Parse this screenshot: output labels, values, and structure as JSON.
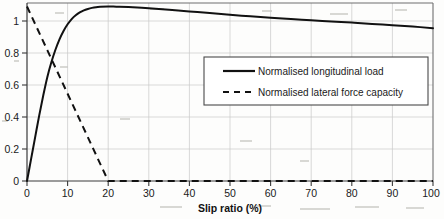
{
  "chart_data": {
    "type": "line",
    "title": "",
    "xlabel": "Slip ratio  (%)",
    "ylabel": "",
    "xlim": [
      0,
      100
    ],
    "ylim": [
      0,
      1.02
    ],
    "grid": true,
    "legend_position": "center-right",
    "xticks": [
      0,
      10,
      20,
      30,
      40,
      50,
      60,
      70,
      80,
      90,
      100
    ],
    "xticklabels": [
      "0",
      "10",
      "20",
      "30",
      "40",
      "50",
      "60",
      "70",
      "80",
      "90",
      "100"
    ],
    "yticks": [
      0,
      0.2,
      0.4,
      0.6,
      0.8,
      1
    ],
    "yticklabels": [
      "0",
      "0.2",
      "0.4",
      "0.6",
      "0.8",
      "1"
    ],
    "series": [
      {
        "name": "Normalised longitudinal load",
        "style": "solid",
        "color": "#111111",
        "x": [
          0,
          1,
          2,
          3,
          4,
          5,
          6,
          7,
          8,
          9,
          10,
          11,
          12,
          13,
          14,
          15,
          16,
          17,
          18,
          20,
          22,
          25,
          30,
          35,
          40,
          45,
          50,
          55,
          60,
          65,
          70,
          75,
          80,
          85,
          90,
          95,
          100
        ],
        "values": [
          0,
          0.125,
          0.25,
          0.375,
          0.49,
          0.595,
          0.68,
          0.752,
          0.812,
          0.86,
          0.898,
          0.928,
          0.95,
          0.966,
          0.978,
          0.986,
          0.992,
          0.996,
          0.998,
          1.0,
          0.999,
          0.997,
          0.99,
          0.981,
          0.972,
          0.962,
          0.952,
          0.944,
          0.936,
          0.928,
          0.921,
          0.914,
          0.908,
          0.9,
          0.893,
          0.885,
          0.876
        ]
      },
      {
        "name": "Normalised lateral force capacity",
        "style": "dashed",
        "color": "#111111",
        "x": [
          0,
          5,
          10,
          15,
          20,
          30,
          40,
          50,
          60,
          70,
          80,
          90,
          100
        ],
        "values": [
          1.0,
          0.75,
          0.5,
          0.25,
          0.0,
          0.0,
          0.0,
          0.0,
          0.0,
          0.0,
          0.0,
          0.0,
          0.0
        ]
      }
    ],
    "legend": [
      {
        "label": "Normalised longitudinal load",
        "style": "solid"
      },
      {
        "label": "Normalised lateral force capacity",
        "style": "dashed"
      }
    ]
  },
  "colors": {
    "line": "#111111",
    "grid": "#c9c9c9",
    "frame": "#6f6f6f",
    "background": "#fdfdfc"
  }
}
